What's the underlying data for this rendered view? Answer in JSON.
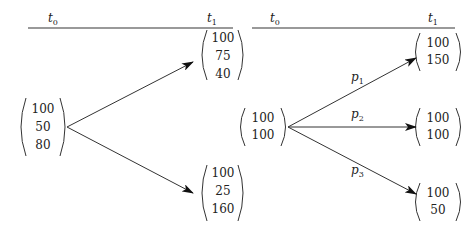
{
  "left_tree": {
    "time_labels": {
      "t0": "t",
      "t0_sub": "0",
      "t1": "t",
      "t1_sub": "1"
    },
    "root": [
      "100",
      "50",
      "80"
    ],
    "up": [
      "100",
      "75",
      "40"
    ],
    "down": [
      "100",
      "25",
      "160"
    ]
  },
  "right_tree": {
    "time_labels": {
      "t0": "t",
      "t0_sub": "0",
      "t1": "t",
      "t1_sub": "1"
    },
    "root": [
      "100",
      "100"
    ],
    "up": [
      "100",
      "150"
    ],
    "mid": [
      "100",
      "100"
    ],
    "down": [
      "100",
      "50"
    ],
    "probabilities": [
      {
        "p": "p",
        "sub": "1"
      },
      {
        "p": "p",
        "sub": "2"
      },
      {
        "p": "p",
        "sub": "3"
      }
    ]
  },
  "colors": {
    "line": "#777777",
    "arrow": "#111111",
    "text": "#222222"
  }
}
